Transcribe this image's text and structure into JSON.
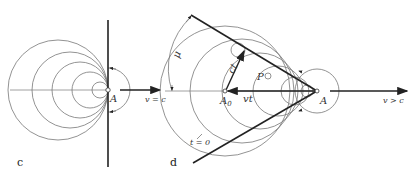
{
  "panels": [
    {
      "id": "c",
      "label": "c",
      "point_label": "A",
      "velocity_label": "v = c"
    },
    {
      "id": "d",
      "label": "d",
      "point_label": "A",
      "origin_label": "A",
      "origin_subscript": "0",
      "velocity_label": "v > c",
      "angle_label": "μ",
      "radius_label": "ct",
      "distance_label": "vt",
      "tangent_point_label": "P",
      "circle_label": "t = 0"
    }
  ]
}
